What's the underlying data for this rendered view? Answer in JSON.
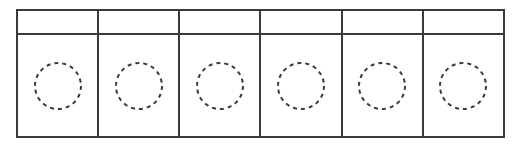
{
  "page": {
    "background_color": "#ffffff",
    "width": 521,
    "height": 145
  },
  "grid": {
    "column_count": 6,
    "row_count": 2,
    "line_color": "#3a3a3a",
    "line_width_px": 2,
    "header_row": {
      "name": "header-row",
      "height_px": 22,
      "cells": [
        {
          "label": ""
        },
        {
          "label": ""
        },
        {
          "label": ""
        },
        {
          "label": ""
        },
        {
          "label": ""
        },
        {
          "label": ""
        }
      ]
    },
    "body_row": {
      "name": "body-row",
      "height_px": 101,
      "cells": [
        {
          "label": "",
          "shape": "dashed-circle",
          "shape_color": "#3a3a3a",
          "diameter_px": 48
        },
        {
          "label": "",
          "shape": "dashed-circle",
          "shape_color": "#3a3a3a",
          "diameter_px": 48
        },
        {
          "label": "",
          "shape": "dashed-circle",
          "shape_color": "#3a3a3a",
          "diameter_px": 48
        },
        {
          "label": "",
          "shape": "dashed-circle",
          "shape_color": "#3a3a3a",
          "diameter_px": 48
        },
        {
          "label": "",
          "shape": "dashed-circle",
          "shape_color": "#3a3a3a",
          "diameter_px": 48
        },
        {
          "label": "",
          "shape": "dashed-circle",
          "shape_color": "#3a3a3a",
          "diameter_px": 48
        }
      ]
    }
  }
}
